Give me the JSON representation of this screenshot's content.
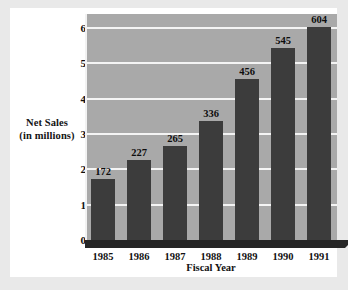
{
  "chart_data": {
    "type": "bar",
    "title": "",
    "categories": [
      "1985",
      "1986",
      "1987",
      "1988",
      "1989",
      "1990",
      "1991"
    ],
    "values": [
      172,
      227,
      265,
      336,
      456,
      545,
      604
    ],
    "xlabel": "Fiscal Year",
    "ylabel": "Net Sales (in millions)",
    "ylabel_line1": "Net Sales",
    "ylabel_line2": "(in millions)",
    "ytick_labels": [
      "0",
      "1",
      "2",
      "3",
      "4",
      "5",
      "6"
    ],
    "ytick_values": [
      0,
      1,
      2,
      3,
      4,
      5,
      6
    ],
    "ylim": [
      0,
      6.4
    ],
    "value_scale": 100,
    "grid": true,
    "legend": "none",
    "bar_color": "#3c3c3c",
    "plot_background": "#a9a9a9",
    "gridline_color": "#f4f4f4",
    "card_background": "#ffffff",
    "page_background": "#e9e9e9"
  }
}
